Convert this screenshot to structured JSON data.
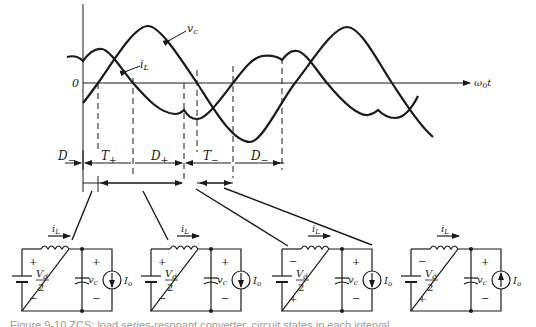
{
  "figure": {
    "axis": {
      "origin_label": "0",
      "x_label": "ω",
      "x_label_sub": "0",
      "x_label_tail": "t"
    },
    "curves": [
      {
        "name": "v_c",
        "label": "v",
        "sub": "c"
      },
      {
        "name": "i_L",
        "label": "i",
        "sub": "L"
      }
    ],
    "intervals": [
      {
        "label": "D",
        "sub": "−"
      },
      {
        "label": "T",
        "sub": "+"
      },
      {
        "label": "D",
        "sub": "+"
      },
      {
        "label": "T",
        "sub": "−"
      },
      {
        "label": "D",
        "sub": "−"
      }
    ],
    "circuits": [
      {
        "id": "D-minus",
        "iL_label": "i",
        "iL_sub": "L",
        "source_top": "+",
        "source_bottom": "−",
        "source_num": "V",
        "source_num_sub": "d",
        "source_den": "2",
        "vc_top": "+",
        "vc_bottom": "−",
        "vc_label": "v",
        "vc_sub": "c",
        "io_label": "I",
        "io_sub": "o",
        "io_direction": "down"
      },
      {
        "id": "T-plus",
        "iL_label": "i",
        "iL_sub": "L",
        "source_top": "+",
        "source_bottom": "−",
        "source_num": "V",
        "source_num_sub": "d",
        "source_den": "2",
        "vc_top": "+",
        "vc_bottom": "−",
        "vc_label": "v",
        "vc_sub": "c",
        "io_label": "I",
        "io_sub": "o",
        "io_direction": "down"
      },
      {
        "id": "D-plus",
        "iL_label": "i",
        "iL_sub": "L",
        "source_top": "−",
        "source_bottom": "+",
        "source_num": "V",
        "source_num_sub": "d",
        "source_den": "2",
        "vc_top": "+",
        "vc_bottom": "−",
        "vc_label": "v",
        "vc_sub": "c",
        "io_label": "I",
        "io_sub": "o",
        "io_direction": "down"
      },
      {
        "id": "T-minus",
        "iL_label": "i",
        "iL_sub": "L",
        "source_top": "−",
        "source_bottom": "+",
        "source_num": "V",
        "source_num_sub": "d",
        "source_den": "2",
        "vc_top": "+",
        "vc_bottom": "−",
        "vc_label": "v",
        "vc_sub": "c",
        "io_label": "I",
        "io_sub": "o",
        "io_direction": "up"
      }
    ],
    "caption": "Figure 9-10  ZCS: load series-resonant converter, circuit states in each interval."
  }
}
